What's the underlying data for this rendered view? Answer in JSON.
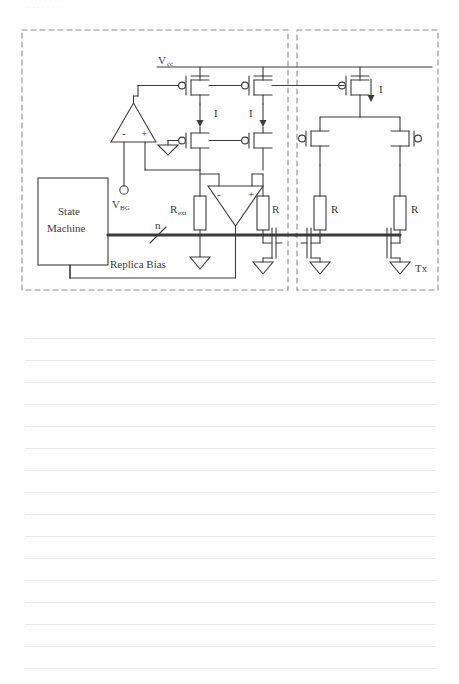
{
  "page": {
    "background_color": "#fefefe",
    "ruled_line_color": "#ececed",
    "ruled_line_count": 16,
    "top_cutoff_artifact": "......."
  },
  "figure": {
    "type": "circuit-schematic",
    "ink_color": "#3b3b3b",
    "dashed_blocks": [
      {
        "name": "replica-bias-block",
        "label": "Replica Bias"
      },
      {
        "name": "tx-block",
        "label": "Tx"
      }
    ],
    "labels": {
      "vcc": "V",
      "vcc_sub": "cc",
      "vbg": "V",
      "vbg_sub": "BG",
      "state_machine_line1": "State",
      "state_machine_line2": "Machine",
      "rext": "R",
      "rext_sub": "ext",
      "bus_width": "n",
      "replica_bias": "Replica Bias",
      "tx": "Tx",
      "current_1": "I",
      "current_2": "I",
      "current_3": "I",
      "resistor_r1": "R",
      "resistor_r2": "R",
      "resistor_r3": "R",
      "opamp1_minus": "-",
      "opamp1_plus": "+",
      "opamp2_minus": "-",
      "opamp2_plus": "+"
    },
    "components": {
      "pmos_count": 3,
      "nmos_count": 6,
      "opamp_count": 2,
      "resistor_count": 4,
      "ground_count": 6,
      "current_arrow_count": 3,
      "terminal_node": "VBG"
    }
  }
}
